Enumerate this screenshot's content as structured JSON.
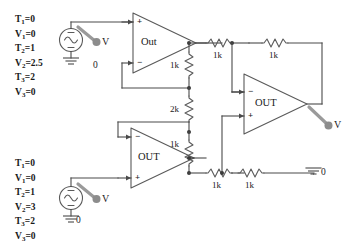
{
  "diagram": {
    "colors": {
      "wire": "#4a4a4a",
      "component": "#5a5a5a",
      "text": "#1a1a1a",
      "probe": "#8c8c8c",
      "background": "#ffffff"
    }
  },
  "sources": {
    "top": {
      "name": "pulse-source-top",
      "symbol": "sine-wave-icon",
      "probe_label": "V",
      "ground_label": "0",
      "params": [
        {
          "name": "T",
          "index": "1",
          "value": "0"
        },
        {
          "name": "V",
          "index": "1",
          "value": "0"
        },
        {
          "name": "T",
          "index": "2",
          "value": "1"
        },
        {
          "name": "V",
          "index": "2",
          "value": "2.5"
        },
        {
          "name": "T",
          "index": "3",
          "value": "2"
        },
        {
          "name": "V",
          "index": "3",
          "value": "0"
        }
      ]
    },
    "bottom": {
      "name": "pulse-source-bottom",
      "symbol": "sine-wave-icon",
      "probe_label": "V",
      "ground_label": "0",
      "params": [
        {
          "name": "T",
          "index": "1",
          "value": "0"
        },
        {
          "name": "V",
          "index": "1",
          "value": "0"
        },
        {
          "name": "T",
          "index": "2",
          "value": "1"
        },
        {
          "name": "V",
          "index": "2",
          "value": "3"
        },
        {
          "name": "T",
          "index": "3",
          "value": "2"
        },
        {
          "name": "V",
          "index": "3",
          "value": "0"
        }
      ]
    }
  },
  "opamps": [
    {
      "id": "top-left",
      "label": "Out",
      "top_pin": "+",
      "bottom_pin": "−"
    },
    {
      "id": "bottom-left",
      "label": "OUT",
      "top_pin": "−",
      "bottom_pin": "+"
    },
    {
      "id": "right",
      "label": "OUT",
      "top_pin": "−",
      "bottom_pin": "+"
    }
  ],
  "resistors": [
    {
      "id": "r-center-top",
      "label": "1k",
      "orientation": "vertical"
    },
    {
      "id": "r-center-mid",
      "label": "2k",
      "orientation": "vertical"
    },
    {
      "id": "r-center-bottom",
      "label": "1k",
      "orientation": "vertical"
    },
    {
      "id": "r-top-1",
      "label": "1k",
      "orientation": "horizontal"
    },
    {
      "id": "r-top-2",
      "label": "1k",
      "orientation": "horizontal"
    },
    {
      "id": "r-bottom-1",
      "label": "1k",
      "orientation": "horizontal"
    },
    {
      "id": "r-bottom-2",
      "label": "1k",
      "orientation": "horizontal"
    }
  ],
  "probes": [
    {
      "id": "probe-source-top",
      "label": "V"
    },
    {
      "id": "probe-source-bottom",
      "label": "V"
    },
    {
      "id": "probe-output-right",
      "label": "V"
    }
  ],
  "grounds": [
    {
      "id": "gnd-source-top",
      "label": ""
    },
    {
      "id": "gnd-node-top",
      "label": "0"
    },
    {
      "id": "gnd-source-bottom",
      "label": "0"
    },
    {
      "id": "gnd-right",
      "label": "0"
    }
  ]
}
